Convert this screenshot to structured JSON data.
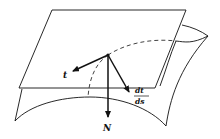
{
  "diagram": {
    "colors": {
      "ink": "#111111",
      "background": "#ffffff"
    },
    "labels": {
      "tangent": "t",
      "normal": "N",
      "derivative_numerator": "dt",
      "derivative_denominator": "ds"
    },
    "elements": [
      {
        "name": "tangent-plane",
        "shape": "parallelogram"
      },
      {
        "name": "curved-surface",
        "shape": "saddle-like sheet"
      },
      {
        "name": "surface-curve",
        "style": "dashed where hidden"
      },
      {
        "name": "tangent-vector",
        "label": "t"
      },
      {
        "name": "normal-vector",
        "label": "N"
      },
      {
        "name": "curvature-vector",
        "label": "dt/ds"
      }
    ]
  }
}
